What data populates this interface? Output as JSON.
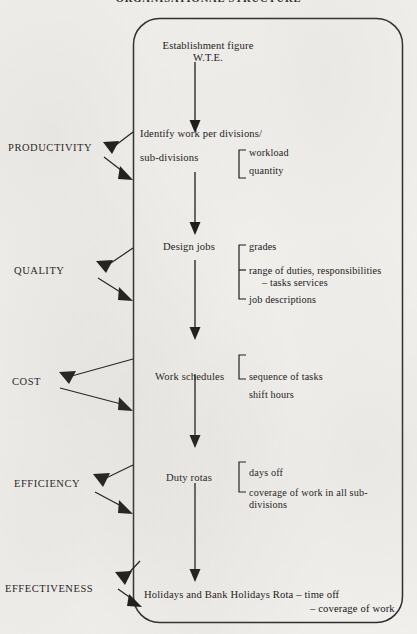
{
  "document": {
    "title": "ORGANISATIONAL STRUCTURE",
    "background_color": "#f2f1ee",
    "ink_color": "#141414"
  },
  "flow": {
    "start_node": {
      "line1": "Establishment figure",
      "line2": "W.T.E."
    },
    "stages": [
      {
        "label": "PRODUCTIVITY",
        "node": {
          "line1": "Identify work per divisions/",
          "line2": "sub-divisions"
        },
        "details": [
          "workload",
          "quantity"
        ]
      },
      {
        "label": "QUALITY",
        "node": {
          "line1": "Design jobs",
          "line2": ""
        },
        "details": [
          "grades",
          "range of duties, responsibilities",
          "– tasks services",
          "job descriptions"
        ]
      },
      {
        "label": "COST",
        "node": {
          "line1": "Work schedules",
          "line2": ""
        },
        "details": [
          "sequence of tasks",
          "shift hours"
        ]
      },
      {
        "label": "EFFICIENCY",
        "node": {
          "line1": "Duty rotas",
          "line2": ""
        },
        "details": [
          "days off",
          "coverage of work in all sub-",
          "divisions"
        ]
      },
      {
        "label": "EFFECTIVENESS",
        "node": {
          "line1": "Holidays and Bank Holidays Rota – time off",
          "line2": "– coverage of work"
        },
        "details": []
      }
    ]
  }
}
